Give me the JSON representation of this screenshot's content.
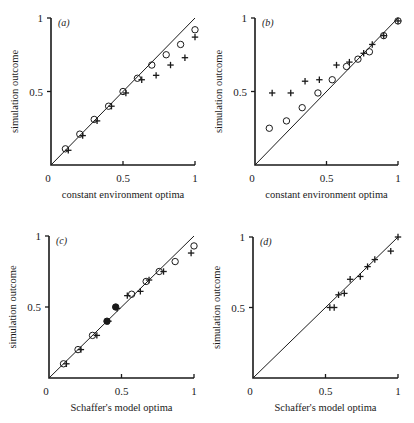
{
  "chart_data": [
    {
      "id": "a",
      "type": "scatter",
      "panel_label": "(a)",
      "title": "",
      "xlabel": "constant environment optima",
      "ylabel": "simulation outcome",
      "xlim": [
        0,
        1
      ],
      "ylim": [
        0,
        1
      ],
      "xticks": [
        "0",
        "0.5",
        "1"
      ],
      "yticks": [
        "0.5",
        "1"
      ],
      "reference_line": "y = x",
      "grid": false,
      "series": [
        {
          "name": "circles",
          "marker": "circle",
          "x": [
            0.1,
            0.2,
            0.3,
            0.4,
            0.5,
            0.6,
            0.7,
            0.8,
            0.9,
            1.0
          ],
          "y": [
            0.11,
            0.21,
            0.31,
            0.4,
            0.5,
            0.59,
            0.68,
            0.75,
            0.82,
            0.92
          ]
        },
        {
          "name": "crosses",
          "marker": "cross",
          "x": [
            0.12,
            0.22,
            0.32,
            0.42,
            0.52,
            0.63,
            0.73,
            0.83,
            0.93,
            1.0
          ],
          "y": [
            0.1,
            0.2,
            0.3,
            0.4,
            0.49,
            0.58,
            0.61,
            0.68,
            0.73,
            0.87
          ]
        }
      ]
    },
    {
      "id": "b",
      "type": "scatter",
      "panel_label": "(b)",
      "title": "",
      "xlabel": "constant environment optima",
      "ylabel": "simulation outcome",
      "xlim": [
        0,
        1
      ],
      "ylim": [
        0,
        1
      ],
      "xticks": [
        "0",
        "0.5",
        "1"
      ],
      "yticks": [
        "0.5",
        "1"
      ],
      "reference_line": "y = x",
      "grid": false,
      "series": [
        {
          "name": "circles",
          "marker": "circle",
          "x": [
            0.1,
            0.22,
            0.33,
            0.44,
            0.54,
            0.64,
            0.72,
            0.8,
            0.9,
            1.0
          ],
          "y": [
            0.25,
            0.3,
            0.39,
            0.49,
            0.58,
            0.67,
            0.72,
            0.77,
            0.88,
            0.98
          ]
        },
        {
          "name": "crosses",
          "marker": "cross",
          "x": [
            0.12,
            0.25,
            0.35,
            0.45,
            0.57,
            0.66,
            0.76,
            0.82,
            0.9,
            1.0
          ],
          "y": [
            0.49,
            0.49,
            0.57,
            0.58,
            0.68,
            0.7,
            0.76,
            0.82,
            0.88,
            0.98
          ]
        }
      ]
    },
    {
      "id": "c",
      "type": "scatter",
      "panel_label": "(c)",
      "title": "",
      "xlabel": "Schaffer's model optima",
      "ylabel": "simulation outcome",
      "xlim": [
        0,
        1
      ],
      "ylim": [
        0,
        1
      ],
      "xticks": [
        "0",
        "0.5",
        "1"
      ],
      "yticks": [
        "0.5",
        "1"
      ],
      "reference_line": "y = x",
      "grid": false,
      "series": [
        {
          "name": "circles",
          "marker": "circle",
          "x": [
            0.1,
            0.2,
            0.3,
            0.4,
            0.46,
            0.57,
            0.67,
            0.76,
            0.87,
            1.0
          ],
          "y": [
            0.1,
            0.2,
            0.3,
            0.4,
            0.5,
            0.59,
            0.68,
            0.75,
            0.82,
            0.93
          ],
          "filled": [
            false,
            false,
            false,
            true,
            true,
            false,
            false,
            false,
            false,
            false
          ]
        },
        {
          "name": "crosses",
          "marker": "cross",
          "x": [
            0.12,
            0.22,
            0.33,
            0.41,
            0.47,
            0.54,
            0.63,
            0.69,
            0.79,
            0.98
          ],
          "y": [
            0.1,
            0.2,
            0.3,
            0.4,
            0.49,
            0.58,
            0.61,
            0.69,
            0.75,
            0.88
          ]
        }
      ]
    },
    {
      "id": "d",
      "type": "scatter",
      "panel_label": "(d)",
      "title": "",
      "xlabel": "Schaffer's model optima",
      "ylabel": "simulation outcome",
      "xlim": [
        0,
        1
      ],
      "ylim": [
        0,
        1
      ],
      "xticks": [
        "0",
        "0.5",
        "1"
      ],
      "yticks": [
        "0.5",
        "1"
      ],
      "reference_line": "y = x",
      "grid": false,
      "series": [
        {
          "name": "crosses",
          "marker": "cross",
          "x": [
            0.53,
            0.56,
            0.59,
            0.63,
            0.67,
            0.74,
            0.79,
            0.84,
            0.95,
            1.0
          ],
          "y": [
            0.5,
            0.5,
            0.59,
            0.6,
            0.7,
            0.72,
            0.79,
            0.84,
            0.9,
            1.0
          ]
        }
      ]
    }
  ],
  "layout": {
    "panels": [
      {
        "x0": 51,
        "x1": 195,
        "y0": 165,
        "y1": 18
      },
      {
        "x0": 255,
        "x1": 398,
        "y0": 165,
        "y1": 18
      },
      {
        "x0": 49,
        "x1": 194,
        "y0": 378,
        "y1": 236
      },
      {
        "x0": 253,
        "x1": 398,
        "y0": 378,
        "y1": 237
      }
    ]
  }
}
